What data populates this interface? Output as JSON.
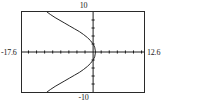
{
  "screen": {
    "title": "graphing-calculator-plot",
    "background_color": "#ffffff",
    "frame_color": "#2a2a2a",
    "axis_color": "#1a1a1a",
    "curve_color": "#222222"
  },
  "window": {
    "xmin_label": "-17.6",
    "xmax_label": "12.6",
    "ymax_label": "10",
    "ymin_label": "-10"
  },
  "chart_data": {
    "type": "line",
    "title": "",
    "xlabel": "",
    "ylabel": "",
    "xlim": [
      -17.6,
      12.6
    ],
    "ylim": [
      -10,
      10
    ],
    "grid": false,
    "legend": "none",
    "axes": {
      "x_axis_at_y": 0,
      "y_axis_at_x": 0,
      "x_tick_step": 2,
      "y_tick_step": 2,
      "x_ticks": [
        -16,
        -14,
        -12,
        -10,
        -8,
        -6,
        -4,
        -2,
        0,
        2,
        4,
        6,
        8,
        10,
        12
      ],
      "y_ticks": [
        -8,
        -6,
        -4,
        -2,
        0,
        2,
        4,
        6,
        8
      ]
    },
    "series": [
      {
        "name": "curve",
        "description": "sideways parabola opening left with vertex near origin",
        "points": [
          [
            0.6,
            0.0
          ],
          [
            0.4,
            1.2
          ],
          [
            0.0,
            2.0
          ],
          [
            -0.6,
            2.8
          ],
          [
            -1.4,
            3.6
          ],
          [
            -2.4,
            4.4
          ],
          [
            -3.4,
            5.1
          ],
          [
            -4.6,
            5.8
          ],
          [
            -5.8,
            6.5
          ],
          [
            -7.0,
            7.2
          ],
          [
            -8.2,
            7.9
          ],
          [
            -9.4,
            8.6
          ],
          [
            -10.6,
            9.4
          ],
          [
            -11.4,
            10.0
          ],
          [
            0.4,
            -1.2
          ],
          [
            0.0,
            -2.0
          ],
          [
            -0.6,
            -2.8
          ],
          [
            -1.4,
            -3.6
          ],
          [
            -2.4,
            -4.4
          ],
          [
            -3.4,
            -5.1
          ],
          [
            -4.6,
            -5.8
          ],
          [
            -5.8,
            -6.5
          ],
          [
            -7.0,
            -7.2
          ],
          [
            -8.2,
            -7.9
          ],
          [
            -9.4,
            -8.6
          ],
          [
            -10.6,
            -9.4
          ],
          [
            -11.4,
            -10.0
          ]
        ]
      }
    ]
  }
}
